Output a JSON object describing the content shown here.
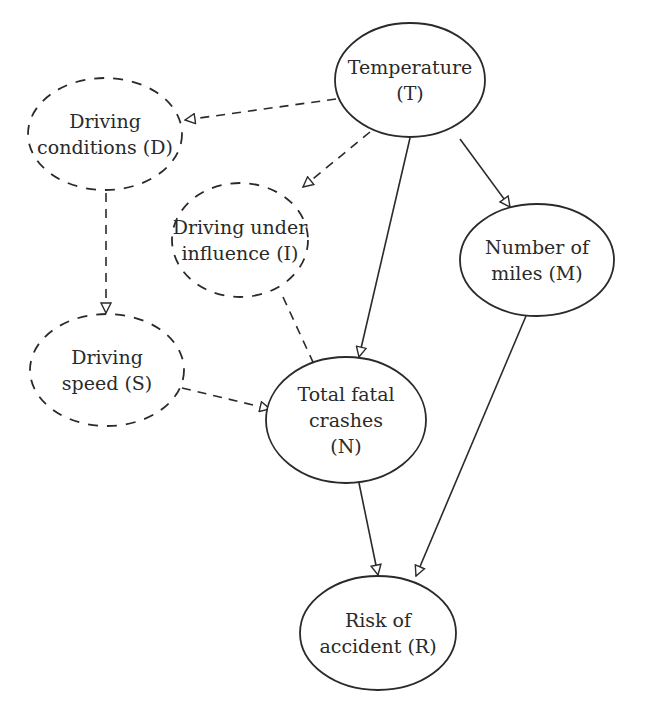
{
  "diagram": {
    "type": "causal-network",
    "nodes": [
      {
        "id": "T",
        "lines": [
          "Temperature",
          "(T)"
        ],
        "style": "solid",
        "cx": 410,
        "cy": 80,
        "rx": 75,
        "ry": 57
      },
      {
        "id": "D",
        "lines": [
          "Driving",
          "conditions (D)"
        ],
        "style": "dashed",
        "cx": 105,
        "cy": 134,
        "rx": 77,
        "ry": 56
      },
      {
        "id": "I",
        "lines": [
          "Driving under",
          "influence (I)"
        ],
        "style": "dashed",
        "cx": 240,
        "cy": 240,
        "rx": 68,
        "ry": 57
      },
      {
        "id": "M",
        "lines": [
          "Number of",
          "miles (M)"
        ],
        "style": "solid",
        "cx": 537,
        "cy": 260,
        "rx": 77,
        "ry": 56
      },
      {
        "id": "S",
        "lines": [
          "Driving",
          "speed (S)"
        ],
        "style": "dashed",
        "cx": 107,
        "cy": 370,
        "rx": 77,
        "ry": 56
      },
      {
        "id": "N",
        "lines": [
          "Total fatal",
          "crashes",
          "(N)"
        ],
        "style": "solid",
        "cx": 346,
        "cy": 420,
        "rx": 80,
        "ry": 63
      },
      {
        "id": "R",
        "lines": [
          "Risk of",
          "accident (R)"
        ],
        "style": "solid",
        "cx": 378,
        "cy": 633,
        "rx": 78,
        "ry": 57
      }
    ],
    "edges": [
      {
        "from": "T",
        "to": "D",
        "style": "dashed",
        "x1": 336,
        "y1": 99,
        "x2": 185,
        "y2": 120
      },
      {
        "from": "T",
        "to": "I",
        "style": "dashed",
        "x1": 370,
        "y1": 132,
        "x2": 303,
        "y2": 187
      },
      {
        "from": "T",
        "to": "N",
        "style": "solid",
        "x1": 410,
        "y1": 138,
        "x2": 359,
        "y2": 357
      },
      {
        "from": "T",
        "to": "M",
        "style": "solid",
        "x1": 460,
        "y1": 139,
        "x2": 510,
        "y2": 207
      },
      {
        "from": "D",
        "to": "S",
        "style": "dashed",
        "x1": 106,
        "y1": 193,
        "x2": 106,
        "y2": 313
      },
      {
        "from": "I",
        "to": "N",
        "style": "dashed",
        "x1": 283,
        "y1": 297,
        "x2": 318,
        "y2": 373
      },
      {
        "from": "S",
        "to": "N",
        "style": "dashed",
        "x1": 182,
        "y1": 388,
        "x2": 270,
        "y2": 409
      },
      {
        "from": "N",
        "to": "R",
        "style": "solid",
        "x1": 359,
        "y1": 483,
        "x2": 378,
        "y2": 575
      },
      {
        "from": "M",
        "to": "R",
        "style": "solid",
        "x1": 526,
        "y1": 316,
        "x2": 416,
        "y2": 576
      }
    ]
  }
}
